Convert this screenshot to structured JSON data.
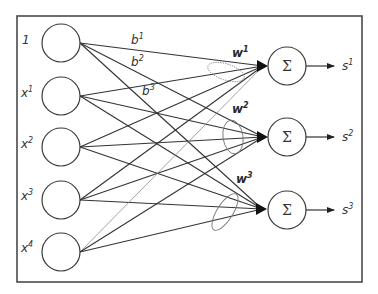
{
  "diagram": {
    "type": "single-layer neural network",
    "inputs": [
      {
        "id": "bias",
        "label": "1",
        "sup": "",
        "cy": 43
      },
      {
        "id": "x1",
        "label": "x",
        "sup": "1",
        "cy": 96
      },
      {
        "id": "x2",
        "label": "x",
        "sup": "2",
        "cy": 147
      },
      {
        "id": "x3",
        "label": "x",
        "sup": "3",
        "cy": 200
      },
      {
        "id": "x4",
        "label": "x",
        "sup": "4",
        "cy": 252
      }
    ],
    "bias_labels": [
      {
        "label": "b",
        "sup": "1"
      },
      {
        "label": "b",
        "sup": "2"
      },
      {
        "label": "b",
        "sup": "3"
      }
    ],
    "weight_labels": [
      {
        "label": "w",
        "sup": "1"
      },
      {
        "label": "w",
        "sup": "2"
      },
      {
        "label": "w",
        "sup": "3"
      }
    ],
    "sum_nodes": [
      {
        "symbol": "Σ",
        "output_label": "s",
        "output_sup": "1",
        "cy": 66
      },
      {
        "symbol": "Σ",
        "output_label": "s",
        "output_sup": "2",
        "cy": 137
      },
      {
        "symbol": "Σ",
        "output_label": "s",
        "output_sup": "3",
        "cy": 210
      }
    ],
    "connections": "fully connected: each of 5 input nodes to each of 3 summation nodes",
    "colors": {
      "line": "#333333",
      "frame": "#4a4a4a",
      "ellipse": "#777777",
      "background": "#ffffff"
    }
  }
}
